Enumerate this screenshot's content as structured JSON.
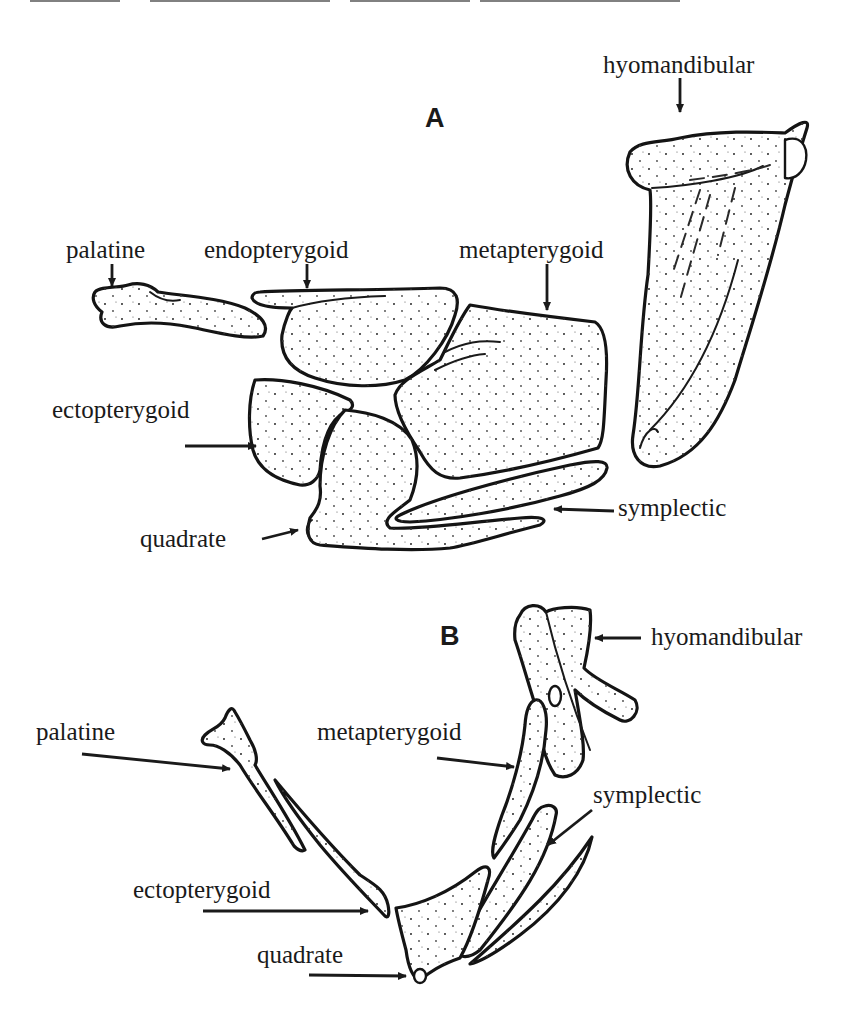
{
  "figure": {
    "type": "anatomical-line-drawing",
    "colors": {
      "ink": "#1a1a1a",
      "background": "#ffffff"
    }
  },
  "panels": [
    {
      "letter": "A",
      "labels": {
        "hyomandibular": "hyomandibular",
        "palatine": "palatine",
        "endopterygoid": "endopterygoid",
        "metapterygoid": "metapterygoid",
        "ectopterygoid": "ectopterygoid",
        "symplectic": "symplectic",
        "quadrate": "quadrate"
      }
    },
    {
      "letter": "B",
      "labels": {
        "hyomandibular": "hyomandibular",
        "palatine": "palatine",
        "metapterygoid": "metapterygoid",
        "symplectic": "symplectic",
        "ectopterygoid": "ectopterygoid",
        "quadrate": "quadrate"
      }
    }
  ]
}
